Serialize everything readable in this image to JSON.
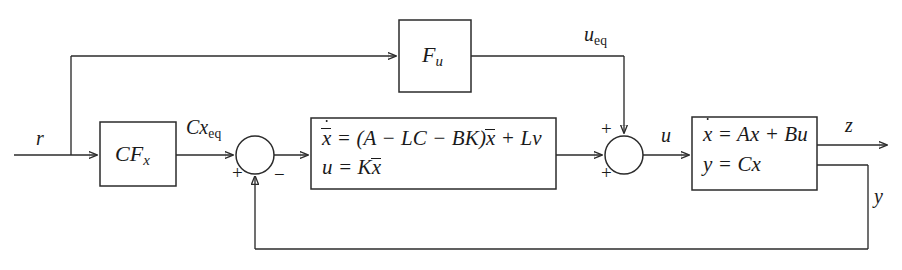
{
  "figure": {
    "name": "observer-based-controller-block-diagram",
    "background_color": "#ffffff",
    "line_color": "#2b2b2b"
  },
  "blocks": [
    {
      "id": "feedforward-u",
      "label": "F",
      "subscript": "u",
      "x": 399,
      "y": 20,
      "w": 72,
      "h": 72
    },
    {
      "id": "feedforward-cfx",
      "label_c": "C",
      "label_f": "F",
      "subscript": "x",
      "x": 100,
      "y": 122,
      "w": 76,
      "h": 64
    },
    {
      "id": "observer-controller",
      "x": 311,
      "y": 118,
      "w": 245,
      "h": 71,
      "equation_line1": "= (A − LC − BK)",
      "equation_line1_lead": "x",
      "equation_line1_tail": "+ Lv",
      "equation_line1_xbar": "x",
      "equation_line2_lhs": "u",
      "equation_line2_rhs": "= K",
      "equation_line2_xbar": "x"
    },
    {
      "id": "plant",
      "x": 692,
      "y": 117,
      "w": 125,
      "h": 73,
      "equation_line1_lhs": "x",
      "equation_line1_rhs": "= Ax + Bu",
      "equation_line2_lhs": "y",
      "equation_line2_rhs": "= Cx"
    }
  ],
  "summing_junctions": [
    {
      "id": "sum-left",
      "cx": 255,
      "cy": 155,
      "r": 19,
      "signs": [
        {
          "symbol": "+",
          "position": "left-below",
          "x": 232,
          "y": 163
        },
        {
          "symbol": "−",
          "position": "right-below",
          "x": 274,
          "y": 165
        }
      ]
    },
    {
      "id": "sum-right",
      "cx": 624,
      "cy": 155,
      "r": 19,
      "signs": [
        {
          "symbol": "+",
          "position": "top-left",
          "x": 601,
          "y": 119
        },
        {
          "symbol": "+",
          "position": "left-below",
          "x": 601,
          "y": 163
        }
      ]
    }
  ],
  "signals": [
    {
      "id": "reference-input",
      "text": "r",
      "x": 36,
      "y": 128
    },
    {
      "id": "cx-eq",
      "text": "Cx",
      "subscript": "eq",
      "x": 186,
      "y": 117
    },
    {
      "id": "u-eq",
      "text": "u",
      "subscript": "eq",
      "x": 584,
      "y": 24
    },
    {
      "id": "control-input-u",
      "text": "u",
      "x": 661,
      "y": 125
    },
    {
      "id": "output-z",
      "text": "z",
      "x": 845,
      "y": 115
    },
    {
      "id": "measurement-y",
      "text": "y",
      "x": 874,
      "y": 186
    }
  ],
  "wires": {
    "main_line_y": 155,
    "top_branch_y": 56,
    "branch_x": 71,
    "feedback_y": 249,
    "feedback_x": 868,
    "ueq_drop_x": 624,
    "ueq_line_y": 56,
    "z_out_y": 145,
    "y_out_y": 165
  }
}
